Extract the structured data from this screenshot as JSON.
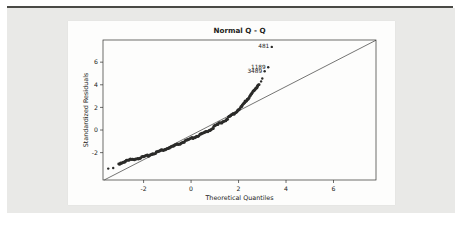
{
  "page": {
    "background": "#ffffff",
    "panel_background": "#e9e9e7",
    "rule_color": "#4a4a46",
    "card_background": "#fdfdfc"
  },
  "chart_data": {
    "type": "scatter",
    "title": "Normal Q - Q",
    "xlabel": "Theoretical Quantiles",
    "ylabel": "Standardized Residuals",
    "xlim": [
      -3.71,
      7.79
    ],
    "ylim": [
      -4.42,
      7.96
    ],
    "x_ticks": [
      -2,
      0,
      2,
      4,
      6
    ],
    "y_ticks": [
      -2,
      0,
      2,
      4,
      6
    ],
    "grid": false,
    "legend": "none",
    "point_color": "#2b2b29",
    "axis_color": "#2f2f2d",
    "reference_line": {
      "x1": -3.66,
      "y1": -4.42,
      "x2": 7.79,
      "y2": 7.94
    },
    "curve": [
      [
        -3.05,
        -3.0
      ],
      [
        -2.85,
        -2.82
      ],
      [
        -2.6,
        -2.65
      ],
      [
        -2.3,
        -2.52
      ],
      [
        -2.0,
        -2.4
      ],
      [
        -1.75,
        -2.2
      ],
      [
        -1.5,
        -2.0
      ],
      [
        -1.25,
        -1.82
      ],
      [
        -1.0,
        -1.64
      ],
      [
        -0.75,
        -1.44
      ],
      [
        -0.5,
        -1.23
      ],
      [
        -0.25,
        -1.0
      ],
      [
        0.0,
        -0.78
      ],
      [
        0.25,
        -0.55
      ],
      [
        0.5,
        -0.33
      ],
      [
        0.75,
        -0.05
      ],
      [
        1.0,
        0.32
      ],
      [
        1.25,
        0.65
      ],
      [
        1.5,
        0.95
      ],
      [
        1.7,
        1.3
      ],
      [
        1.95,
        1.7
      ],
      [
        2.1,
        2.0
      ],
      [
        2.25,
        2.4
      ],
      [
        2.4,
        2.8
      ],
      [
        2.55,
        3.2
      ],
      [
        2.7,
        3.6
      ],
      [
        2.8,
        3.9
      ],
      [
        2.9,
        4.15
      ]
    ],
    "sparse_points": [
      [
        -3.49,
        -3.41
      ],
      [
        -3.28,
        -3.36
      ],
      [
        2.95,
        4.3
      ],
      [
        3.0,
        4.55
      ]
    ],
    "labeled_outliers": [
      {
        "label": "481",
        "x": 3.4,
        "y": 7.35
      },
      {
        "label": "1189",
        "x": 3.25,
        "y": 5.55
      },
      {
        "label": "3489",
        "x": 3.1,
        "y": 5.2
      }
    ]
  }
}
